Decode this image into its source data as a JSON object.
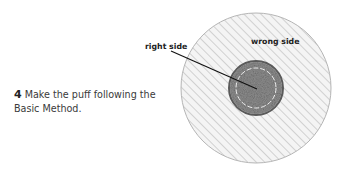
{
  "step": {
    "number": "4",
    "text": " Make the puff following the Basic Method."
  },
  "labels": {
    "right_side": "right side",
    "wrong_side": "wrong side"
  },
  "colors": {
    "outer_fill": "#f3f3f3",
    "hatch": "#b8b8b8",
    "inner_fill": "#8a8a8a",
    "inner_edge": "#555555",
    "stitch": "#eeeeee",
    "leader": "#111111"
  }
}
